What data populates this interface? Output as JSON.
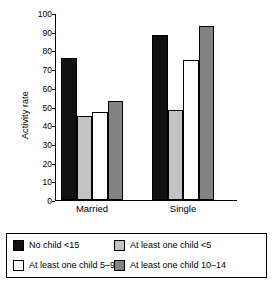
{
  "chart_data": {
    "type": "bar",
    "title": "",
    "xlabel": "",
    "ylabel": "Activity rate",
    "ylim": [
      0,
      100
    ],
    "ytick_step": 10,
    "yticks": [
      "100",
      "90",
      "80",
      "70",
      "60",
      "50",
      "40",
      "30",
      "20",
      "10",
      "0"
    ],
    "grid": false,
    "legend_position": "bottom",
    "categories": [
      "Married",
      "Single"
    ],
    "series": [
      {
        "name": "No child <15",
        "color": "#111111",
        "values": [
          76,
          88
        ]
      },
      {
        "name": "At least one child <5",
        "color": "#c3c3c3",
        "values": [
          45,
          48
        ]
      },
      {
        "name": "At least one child 5–9",
        "color": "#ffffff",
        "values": [
          47,
          75
        ]
      },
      {
        "name": "At least one child 10–14",
        "color": "#838383",
        "values": [
          53,
          93
        ]
      }
    ]
  },
  "legend": {
    "items": [
      {
        "label": "No child <15",
        "color": "#111111"
      },
      {
        "label": "At least one child <5",
        "color": "#c3c3c3"
      },
      {
        "label": "At least one child 5–9",
        "color": "#ffffff"
      },
      {
        "label": "At least one child 10–14",
        "color": "#838383"
      }
    ]
  }
}
